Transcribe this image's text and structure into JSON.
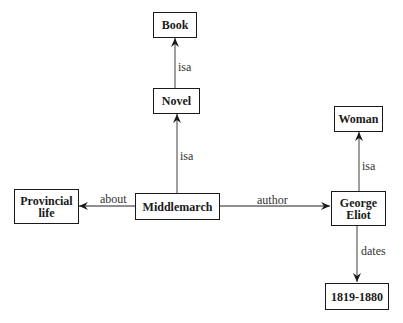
{
  "diagram": {
    "type": "semantic-network",
    "nodes": [
      {
        "id": "book",
        "label": "Book"
      },
      {
        "id": "novel",
        "label": "Novel"
      },
      {
        "id": "middlemarch",
        "label": "Middlemarch"
      },
      {
        "id": "provincial_life",
        "label": "Provincial\nlife"
      },
      {
        "id": "george_eliot",
        "label": "George\nEliot"
      },
      {
        "id": "woman",
        "label": "Woman"
      },
      {
        "id": "dates_value",
        "label": "1819-1880"
      }
    ],
    "edges": [
      {
        "from": "novel",
        "to": "book",
        "label": "isa"
      },
      {
        "from": "middlemarch",
        "to": "novel",
        "label": "isa"
      },
      {
        "from": "middlemarch",
        "to": "provincial_life",
        "label": "about"
      },
      {
        "from": "middlemarch",
        "to": "george_eliot",
        "label": "author"
      },
      {
        "from": "george_eliot",
        "to": "woman",
        "label": "isa"
      },
      {
        "from": "george_eliot",
        "to": "dates_value",
        "label": "dates"
      }
    ]
  },
  "colors": {
    "line": "#6a6a6a",
    "border": "#1a1a1a",
    "text": "#1a1a1a"
  }
}
